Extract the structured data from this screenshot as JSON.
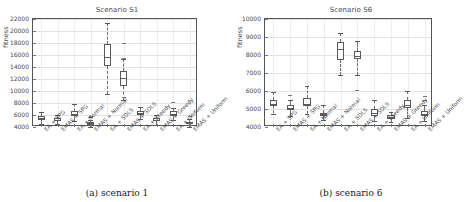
{
  "figure": {
    "panels": [
      {
        "caption": "(a) scenario 1",
        "chart_data": {
          "type": "box",
          "title": "Scenario S1",
          "xlabel": "",
          "ylabel": "fitness",
          "ylim": [
            4000,
            22000
          ],
          "ytick_values": [
            4000,
            6000,
            8000,
            10000,
            12000,
            14000,
            16000,
            18000,
            20000,
            22000
          ],
          "ytick_labels": [
            "4000",
            "6000",
            "8000",
            "10000",
            "12000",
            "14000",
            "16000",
            "18000",
            "20000",
            "22000"
          ],
          "grid": true,
          "legend": "none",
          "categories": [
            "EA + SPG",
            "EMAS + SPG",
            "EA + Normal",
            "EMAS + Normal",
            "EA + SDLS",
            "EMAS + SDLS",
            "EA + Greedy",
            "EMAS + Greedy",
            "EA + Uniform",
            "EMAS + Uniform"
          ],
          "boxes": [
            {
              "label": "EA + SPG",
              "whislo": 4450,
              "q1": 5150,
              "med": 5550,
              "q3": 5900,
              "whishi": 6500,
              "fliers": []
            },
            {
              "label": "EMAS + SPG",
              "whislo": 4450,
              "q1": 4950,
              "med": 5200,
              "q3": 5450,
              "whishi": 6000,
              "fliers": []
            },
            {
              "label": "EA + Normal",
              "whislo": 5000,
              "q1": 5800,
              "med": 6200,
              "q3": 6700,
              "whishi": 7900,
              "fliers": []
            },
            {
              "label": "EMAS + Normal",
              "whislo": 4050,
              "q1": 4400,
              "med": 4600,
              "q3": 4800,
              "whishi": 5200,
              "fliers": [
                5800,
                5600
              ]
            },
            {
              "label": "EA + SDLS",
              "whislo": 9500,
              "q1": 14100,
              "med": 15600,
              "q3": 17800,
              "whishi": 21300,
              "fliers": []
            },
            {
              "label": "EMAS + SDLS",
              "whislo": 8500,
              "q1": 10900,
              "med": 12200,
              "q3": 13400,
              "whishi": 15300,
              "fliers": [
                18000,
                15450,
                9000
              ]
            },
            {
              "label": "EA + Greedy",
              "whislo": 5300,
              "q1": 6000,
              "med": 6300,
              "q3": 6650,
              "whishi": 7300,
              "fliers": []
            },
            {
              "label": "EMAS + Greedy",
              "whislo": 4400,
              "q1": 4950,
              "med": 5200,
              "q3": 5450,
              "whishi": 6000,
              "fliers": []
            },
            {
              "label": "EA + Uniform",
              "whislo": 5100,
              "q1": 5850,
              "med": 6200,
              "q3": 6600,
              "whishi": 7100,
              "fliers": [
                8100
              ]
            },
            {
              "label": "EMAS + Uniform",
              "whislo": 4050,
              "q1": 4450,
              "med": 4650,
              "q3": 4900,
              "whishi": 5300,
              "fliers": [
                5900
              ]
            }
          ]
        }
      },
      {
        "caption": "(b) scenario 6",
        "chart_data": {
          "type": "box",
          "title": "Scenario S6",
          "xlabel": "",
          "ylabel": "fitness",
          "ylim": [
            4000,
            10000
          ],
          "ytick_values": [
            4000,
            5000,
            6000,
            7000,
            8000,
            9000,
            10000
          ],
          "ytick_labels": [
            "4000",
            "5000",
            "6000",
            "7000",
            "8000",
            "9000",
            "10000"
          ],
          "grid": true,
          "legend": "none",
          "categories": [
            "EA + SPG",
            "EMAS + SPG",
            "EA + Normal",
            "EMAS + Normal",
            "EA + SDLS",
            "EMAS + SDLS",
            "EA + Greedy",
            "EMAS + Greedy",
            "EA + Uniform",
            "EMAS + Uniform"
          ],
          "boxes": [
            {
              "label": "EA + SPG",
              "whislo": 4750,
              "q1": 5150,
              "med": 5300,
              "q3": 5500,
              "whishi": 5950,
              "fliers": []
            },
            {
              "label": "EMAS + SPG",
              "whislo": 4600,
              "q1": 4950,
              "med": 5050,
              "q3": 5200,
              "whishi": 5500,
              "fliers": [
                5800
              ]
            },
            {
              "label": "EA + Normal",
              "whislo": 4700,
              "q1": 5150,
              "med": 5300,
              "q3": 5600,
              "whishi": 6300,
              "fliers": []
            },
            {
              "label": "EMAS + Normal",
              "whislo": 4400,
              "q1": 4600,
              "med": 4700,
              "q3": 4800,
              "whishi": 5250,
              "fliers": []
            },
            {
              "label": "EA + SDLS",
              "whislo": 6900,
              "q1": 7700,
              "med": 8350,
              "q3": 8700,
              "whishi": 9250,
              "fliers": []
            },
            {
              "label": "EMAS + SDLS",
              "whislo": 6900,
              "q1": 7800,
              "med": 7950,
              "q3": 8200,
              "whishi": 8800,
              "fliers": [
                6050
              ]
            },
            {
              "label": "EA + Greedy",
              "whislo": 4350,
              "q1": 4600,
              "med": 4800,
              "q3": 5000,
              "whishi": 5500,
              "fliers": []
            },
            {
              "label": "EMAS + Greedy",
              "whislo": 4300,
              "q1": 4450,
              "med": 4550,
              "q3": 4650,
              "whishi": 4850,
              "fliers": []
            },
            {
              "label": "EA + Uniform",
              "whislo": 4500,
              "q1": 5050,
              "med": 5250,
              "q3": 5500,
              "whishi": 6000,
              "fliers": []
            },
            {
              "label": "EMAS + Uniform",
              "whislo": 4350,
              "q1": 4600,
              "med": 4700,
              "q3": 4900,
              "whishi": 5250,
              "fliers": [
                5700,
                5500
              ]
            }
          ]
        }
      }
    ]
  }
}
